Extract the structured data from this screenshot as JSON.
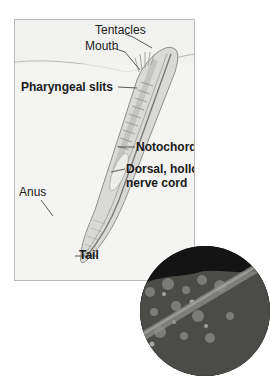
{
  "diagram": {
    "title": "",
    "labels": {
      "tentacles": "Tentacles",
      "mouth": "Mouth",
      "pharyngeal_slits": "Pharyngeal slits",
      "notochord": "Notochord",
      "dorsal_nerve_cord_line1": "Dorsal, hollow",
      "dorsal_nerve_cord_line2": "nerve cord",
      "anus": "Anus",
      "tail": "Tail"
    },
    "colors": {
      "panel_bg": "#f1f1f0",
      "panel_border": "#b9b9b9",
      "body_fill": "#d9d9d6",
      "body_stroke": "#8e8e8c",
      "label_text": "#1a1a1a",
      "photo_bg": "#151515"
    }
  },
  "photo": {
    "description": "circular photograph of lancelet partially buried in gravel"
  }
}
